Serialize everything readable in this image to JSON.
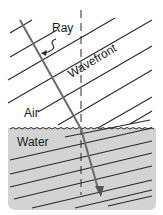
{
  "diagram": {
    "labels": {
      "ray": "Ray",
      "wavefront": "Wavefront",
      "air": "Air",
      "water": "Water"
    },
    "colors": {
      "water_fill": "#d3d3d3",
      "line": "#2a2a2a",
      "ray": "#6b6b6b",
      "background": "#ffffff"
    },
    "elements": [
      "wavefront lines in air (parallel, slanted)",
      "wavefront lines in water (closer spaced)",
      "incident ray (gray arrow)",
      "refracted ray (bent toward normal, arrowhead)",
      "normal (vertical dashed line)",
      "wavy water surface boundary",
      "curved arrow pointing from Ray label to ray"
    ]
  }
}
